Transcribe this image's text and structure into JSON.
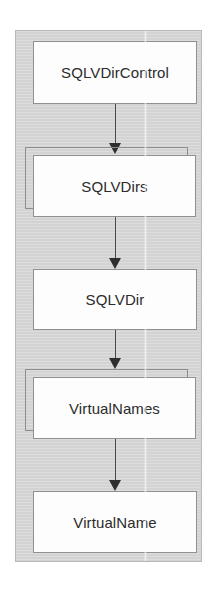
{
  "diagram": {
    "type": "class-hierarchy",
    "title": "",
    "panel": {
      "fill_color": "#d6d6d6",
      "border_color": "#b9b9b9"
    },
    "node_style": {
      "fill_color": "#fdfdfd",
      "border_color": "#909090",
      "text_color": "#2b2b2b"
    },
    "arrow_style": {
      "color": "#2e2e2e",
      "direction": "down",
      "head": "solid-triangle"
    },
    "nodes": [
      {
        "id": "sqlvdircontrol",
        "label": "SQLVDirControl",
        "shape": "rectangle"
      },
      {
        "id": "sqlvdirs",
        "label": "SQLVDirs",
        "shape": "stacked-rectangle"
      },
      {
        "id": "sqlvdir",
        "label": "SQLVDir",
        "shape": "rectangle"
      },
      {
        "id": "virtualnames",
        "label": "VirtualNames",
        "shape": "stacked-rectangle"
      },
      {
        "id": "virtualname",
        "label": "VirtualName",
        "shape": "rectangle"
      }
    ],
    "edges": [
      {
        "from": "sqlvdircontrol",
        "to": "sqlvdirs"
      },
      {
        "from": "sqlvdirs",
        "to": "sqlvdir"
      },
      {
        "from": "sqlvdir",
        "to": "virtualnames"
      },
      {
        "from": "virtualnames",
        "to": "virtualname"
      }
    ]
  }
}
